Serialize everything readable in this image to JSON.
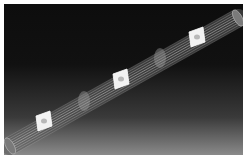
{
  "figure": {
    "title": "",
    "background_top": "#0d0d0d",
    "background_bottom": "#8a8a8a",
    "tube_color": "#bdbdbd",
    "plate_color": "#f2f2f2"
  },
  "tube": {
    "start": [
      10,
      146
    ],
    "end": [
      238,
      18
    ],
    "radius": 9,
    "wire_count": 9
  },
  "plates": [
    {
      "id": "plate-1",
      "cx": 44,
      "cy": 121
    },
    {
      "id": "plate-2",
      "cx": 121,
      "cy": 79
    },
    {
      "id": "plate-3",
      "cx": 197,
      "cy": 37
    }
  ],
  "rings": [
    {
      "id": "ring-1",
      "cx": 84,
      "cy": 101
    },
    {
      "id": "ring-2",
      "cx": 160,
      "cy": 58
    }
  ]
}
